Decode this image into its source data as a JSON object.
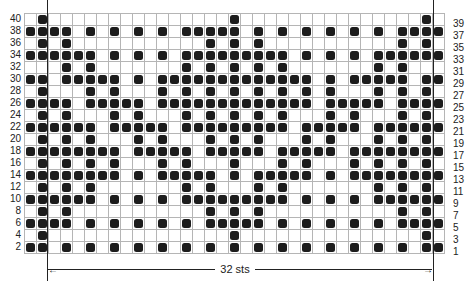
{
  "chart": {
    "columns": 35,
    "rows_shown": 20,
    "cell_color": "#1c1c1c",
    "grid_color": "#b5b5b5",
    "rows": [
      {
        "row": 40,
        "side": "left",
        "pattern": "01000000000000000100000000000000010"
      },
      {
        "row": 39,
        "side": "right",
        "pattern": null
      },
      {
        "row": 38,
        "side": "left",
        "pattern": "11110101010101111101010101010101111"
      },
      {
        "row": 36,
        "side": "left",
        "pattern": "01010000000000010101000000000001010"
      },
      {
        "row": 34,
        "side": "left",
        "pattern": "11111101010101111111110101010111111"
      },
      {
        "row": 32,
        "side": "left",
        "pattern": "00010100000001010101010000000101000"
      },
      {
        "row": 30,
        "side": "left",
        "pattern": "11011111010111111111111101011111011"
      },
      {
        "row": 28,
        "side": "left",
        "pattern": "01000101000101010101010101000101010"
      },
      {
        "row": 26,
        "side": "left",
        "pattern": "11110111110111111111111101111101111"
      },
      {
        "row": 24,
        "side": "left",
        "pattern": "01010001010001010101010001010001010"
      },
      {
        "row": 22,
        "side": "left",
        "pattern": "11111101111101111111110111110111111"
      },
      {
        "row": 20,
        "side": "left",
        "pattern": "01010100010100010101000101000101010"
      },
      {
        "row": 18,
        "side": "left",
        "pattern": "11111111011111011111011111011111111"
      },
      {
        "row": 16,
        "side": "left",
        "pattern": "01010101000101000100010100010101010"
      },
      {
        "row": 14,
        "side": "left",
        "pattern": "11111111010111110101111101011111111"
      },
      {
        "row": 12,
        "side": "left",
        "pattern": "01010100000001010001010000000101010"
      },
      {
        "row": 10,
        "side": "left",
        "pattern": "11111101010101111111110101010111111"
      },
      {
        "row": 8,
        "side": "left",
        "pattern": "01010000000000010101000000000001010"
      },
      {
        "row": 6,
        "side": "left",
        "pattern": "11110101010101011111010101010101111"
      },
      {
        "row": 4,
        "side": "left",
        "pattern": "01000000000000000100000000000000010"
      },
      {
        "row": 2,
        "side": "left",
        "pattern": "11010101010101010101010101010101011"
      }
    ],
    "left_labels": [
      "40",
      "38",
      "36",
      "34",
      "32",
      "30",
      "28",
      "26",
      "24",
      "22",
      "20",
      "18",
      "16",
      "14",
      "12",
      "10",
      "8",
      "6",
      "4",
      "2"
    ],
    "right_labels": [
      "39",
      "37",
      "35",
      "33",
      "31",
      "29",
      "27",
      "25",
      "23",
      "21",
      "19",
      "17",
      "15",
      "13",
      "11",
      "9",
      "7",
      "5",
      "3",
      "1"
    ],
    "repeat_label": "32 sts"
  }
}
